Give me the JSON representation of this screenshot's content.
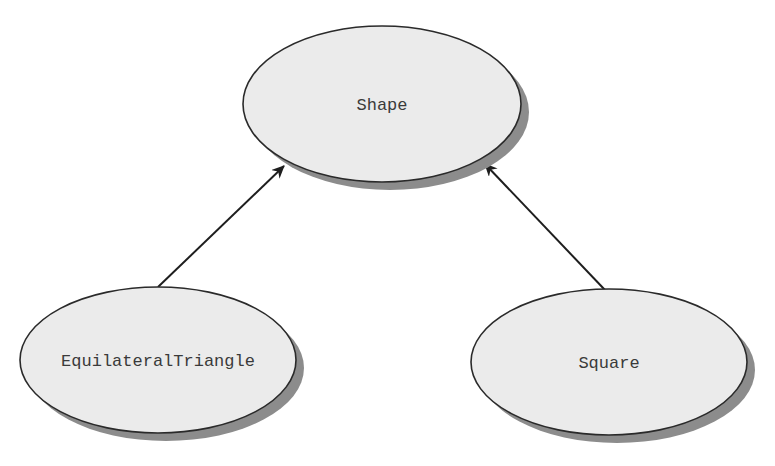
{
  "diagram": {
    "type": "class-inheritance",
    "colors": {
      "node_fill": "#ebebeb",
      "node_stroke": "#2a2a2a",
      "shadow": "#8c8c8c",
      "edge": "#1e1e1e",
      "text": "#3a3a3a"
    },
    "nodes": [
      {
        "id": "shape",
        "label": "Shape",
        "cx": 382,
        "cy": 104,
        "rx": 139,
        "ry": 78
      },
      {
        "id": "equilateral-triangle",
        "label": "EquilateralTriangle",
        "cx": 158,
        "cy": 360,
        "rx": 138,
        "ry": 73
      },
      {
        "id": "square",
        "label": "Square",
        "cx": 609,
        "cy": 362,
        "rx": 138,
        "ry": 73
      }
    ],
    "edges": [
      {
        "from": "equilateral-triangle",
        "to": "shape",
        "arrow": "to"
      },
      {
        "from": "square",
        "to": "shape",
        "arrow": "to"
      }
    ]
  }
}
